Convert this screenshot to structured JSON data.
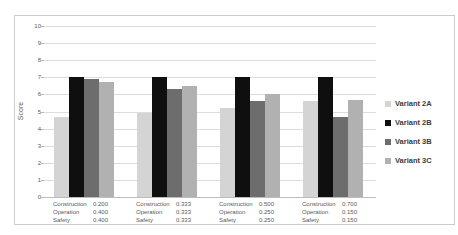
{
  "chart_data": {
    "type": "bar",
    "title": "",
    "xlabel": "",
    "ylabel": "Score",
    "ylim": [
      0,
      10
    ],
    "ytick_step": 1,
    "yticks": [
      0,
      1,
      2,
      3,
      4,
      5,
      6,
      7,
      8,
      9,
      10
    ],
    "grid": true,
    "legend_position": "right",
    "series": [
      {
        "name": "Variant 2A",
        "color": "#d4d4d4",
        "values": [
          4.7,
          4.9,
          5.2,
          5.6
        ]
      },
      {
        "name": "Variant 2B",
        "color": "#0f0f0f",
        "values": [
          7.0,
          7.0,
          7.0,
          7.0
        ]
      },
      {
        "name": "Variant 3B",
        "color": "#6d6d6d",
        "values": [
          6.9,
          6.3,
          5.6,
          4.7
        ]
      },
      {
        "name": "Variant 3C",
        "color": "#b1b1b1",
        "values": [
          6.7,
          6.5,
          6.0,
          5.7
        ]
      }
    ],
    "categories": [
      {
        "weights": [
          [
            "Construction",
            "0.200"
          ],
          [
            "Operation",
            "0.400"
          ],
          [
            "Safety",
            "0.400"
          ]
        ]
      },
      {
        "weights": [
          [
            "Construction",
            "0.333"
          ],
          [
            "Operation",
            "0.333"
          ],
          [
            "Safety",
            "0.333"
          ]
        ]
      },
      {
        "weights": [
          [
            "Construction",
            "0.500"
          ],
          [
            "Operation",
            "0.250"
          ],
          [
            "Safety",
            "0.250"
          ]
        ]
      },
      {
        "weights": [
          [
            "Construction",
            "0.700"
          ],
          [
            "Operation",
            "0.150"
          ],
          [
            "Safety",
            "0.150"
          ]
        ]
      }
    ]
  },
  "colors": {
    "gridline": "#dcdcdc",
    "axis_line": "#bdbdbd",
    "tick_text": "#595959",
    "legend_text": "#3c3c3c",
    "frame_border": "#cccccc"
  }
}
